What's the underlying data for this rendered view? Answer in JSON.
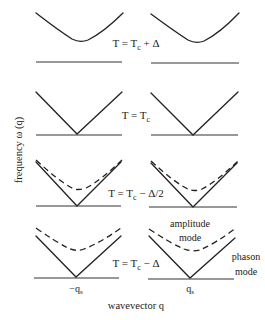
{
  "figure": {
    "y_axis_label": "frequency ω (q)",
    "x_axis_label": "wavevector q",
    "ticks": {
      "left": {
        "main": "−q",
        "sub": "s"
      },
      "right": {
        "main": "q",
        "sub": "s"
      }
    },
    "rows": [
      {
        "id": "above-tc",
        "label": {
          "T": "T = T",
          "sub": "c",
          "rest": " + Δ"
        },
        "solid_shape": "gapped-parabola",
        "dashed_shape": null
      },
      {
        "id": "at-tc",
        "label": {
          "T": "T = T",
          "sub": "c",
          "rest": ""
        },
        "solid_shape": "v",
        "dashed_shape": null
      },
      {
        "id": "half-below",
        "label": {
          "T": "T = T",
          "sub": "c",
          "rest": " − Δ/2"
        },
        "solid_shape": "v",
        "dashed_shape": "gapped-parabola"
      },
      {
        "id": "below",
        "label": {
          "T": "T = T",
          "sub": "c",
          "rest": " − Δ"
        },
        "solid_shape": "v",
        "dashed_shape": "gapped-parabola"
      }
    ],
    "annotations": {
      "amplitude_mode": [
        "amplitude",
        "mode"
      ],
      "phason_mode": [
        "phason",
        "mode"
      ]
    },
    "colors": {
      "line": "#222222",
      "text": "#1a1a1a",
      "background": "#ffffff"
    }
  }
}
